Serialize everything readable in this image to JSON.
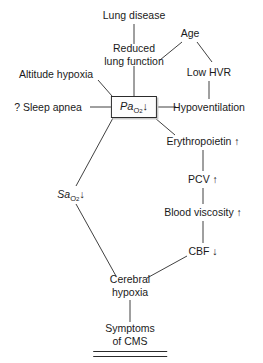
{
  "diagram": {
    "type": "flowchart",
    "canvas": {
      "width": 263,
      "height": 363
    },
    "stroke_color": "#2b2b2b",
    "text_color": "#1a1a1a",
    "background_color": "#ffffff",
    "nodes": [
      {
        "id": "lung_disease",
        "label": "Lung disease",
        "x": 134,
        "y": 15,
        "shape": "plain"
      },
      {
        "id": "age",
        "label": "Age",
        "x": 190,
        "y": 33,
        "shape": "plain"
      },
      {
        "id": "reduced_lung_fn",
        "line1": "Reduced",
        "line2": "lung function",
        "x": 134,
        "y": 55,
        "shape": "plain"
      },
      {
        "id": "low_hvr",
        "label": "Low HVR",
        "x": 209,
        "y": 72,
        "shape": "plain"
      },
      {
        "id": "altitude_hypoxia",
        "label": "Altitude hypoxia",
        "x": 56,
        "y": 74,
        "shape": "plain"
      },
      {
        "id": "sleep_apnea",
        "label": "? Sleep apnea",
        "x": 48,
        "y": 107,
        "shape": "plain"
      },
      {
        "id": "pao2",
        "prefix": "Pa",
        "subscript": "O",
        "sub_index": "2",
        "arrow": "↓",
        "x": 134,
        "y": 107,
        "shape": "box"
      },
      {
        "id": "hypoventilation",
        "label": "Hypoventilation",
        "x": 209,
        "y": 107,
        "shape": "plain"
      },
      {
        "id": "erythropoietin",
        "label": "Erythropoietin ↑",
        "x": 203,
        "y": 141,
        "shape": "plain"
      },
      {
        "id": "pcv",
        "label": "PCV ↑",
        "x": 203,
        "y": 179,
        "shape": "plain"
      },
      {
        "id": "sao2",
        "prefix": "Sa",
        "subscript": "O",
        "sub_index": "2",
        "arrow": "↓",
        "x": 71,
        "y": 194,
        "shape": "plain"
      },
      {
        "id": "blood_viscosity",
        "label": "Blood viscosity ↑",
        "x": 203,
        "y": 212,
        "shape": "plain"
      },
      {
        "id": "cbf",
        "label": "CBF ↓",
        "x": 203,
        "y": 251,
        "shape": "plain"
      },
      {
        "id": "cerebral_hypoxia",
        "line1": "Cerebral",
        "line2": "hypoxia",
        "x": 130,
        "y": 286,
        "shape": "plain"
      },
      {
        "id": "symptoms_cms",
        "line1": "Symptoms",
        "line2": "of CMS",
        "x": 130,
        "y": 335,
        "shape": "terminal"
      }
    ],
    "edges": [
      {
        "from": "lung_disease",
        "to": "reduced_lung_fn",
        "style": "vertical"
      },
      {
        "from": "age",
        "to": "reduced_lung_fn",
        "style": "diagonal"
      },
      {
        "from": "age",
        "to": "low_hvr",
        "style": "diagonal"
      },
      {
        "from": "reduced_lung_fn",
        "to": "pao2",
        "style": "vertical"
      },
      {
        "from": "low_hvr",
        "to": "hypoventilation",
        "style": "vertical"
      },
      {
        "from": "altitude_hypoxia",
        "to": "pao2",
        "style": "diagonal"
      },
      {
        "from": "sleep_apnea",
        "to": "pao2",
        "style": "horizontal"
      },
      {
        "from": "pao2",
        "to": "hypoventilation",
        "style": "horizontal"
      },
      {
        "from": "pao2",
        "to": "erythropoietin",
        "style": "diagonal"
      },
      {
        "from": "pao2",
        "to": "sao2",
        "style": "diagonal"
      },
      {
        "from": "erythropoietin",
        "to": "pcv",
        "style": "vertical"
      },
      {
        "from": "pcv",
        "to": "blood_viscosity",
        "style": "vertical"
      },
      {
        "from": "blood_viscosity",
        "to": "cbf",
        "style": "vertical"
      },
      {
        "from": "cbf",
        "to": "cerebral_hypoxia",
        "style": "diagonal"
      },
      {
        "from": "sao2",
        "to": "cerebral_hypoxia",
        "style": "diagonal"
      },
      {
        "from": "cerebral_hypoxia",
        "to": "symptoms_cms",
        "style": "vertical"
      }
    ]
  }
}
